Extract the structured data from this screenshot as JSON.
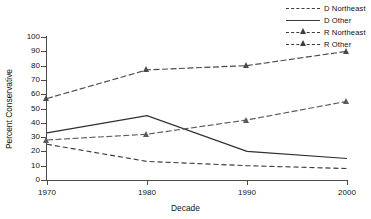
{
  "chart_data": {
    "type": "line",
    "title": "",
    "xlabel": "Decade",
    "ylabel": "Percent Conservative",
    "categories": [
      "1970",
      "1980",
      "1990",
      "2000"
    ],
    "x": [
      1970,
      1980,
      1990,
      2000
    ],
    "xlim": [
      1966,
      2004
    ],
    "ylim": [
      0,
      100
    ],
    "yticks": [
      0,
      10,
      20,
      30,
      40,
      50,
      60,
      70,
      80,
      90,
      100
    ],
    "xticks": [
      1970,
      1980,
      1990,
      2000
    ],
    "grid": false,
    "legend_position": "top-right",
    "series": [
      {
        "name": "D Northeast",
        "values": [
          25,
          13,
          10,
          8
        ],
        "style": "dashed",
        "marker": "none",
        "color": "#3c3c3c"
      },
      {
        "name": "D Other",
        "values": [
          33,
          45,
          20,
          15
        ],
        "style": "solid",
        "marker": "none",
        "color": "#2e2e2e"
      },
      {
        "name": "R Northeast",
        "values": [
          28,
          32,
          42,
          55
        ],
        "style": "dash-dot",
        "marker": "triangle",
        "color": "#5a5a5a"
      },
      {
        "name": "R Other",
        "values": [
          57,
          77,
          80,
          90
        ],
        "style": "dash-dot",
        "marker": "triangle",
        "color": "#4a4a4a"
      }
    ]
  },
  "legend": {
    "items": [
      {
        "label": "D Northeast",
        "style": "dashed",
        "marker": "none"
      },
      {
        "label": "D Other",
        "style": "solid",
        "marker": "none"
      },
      {
        "label": "R Northeast",
        "style": "dash-dot",
        "marker": "triangle"
      },
      {
        "label": "R Other",
        "style": "dash-dot",
        "marker": "triangle"
      }
    ]
  },
  "axes": {
    "x_title": "Decade",
    "y_title": "Percent Conservative",
    "y_tick_labels": [
      "0",
      "10",
      "20",
      "30",
      "40",
      "50",
      "60",
      "70",
      "80",
      "90",
      "100"
    ],
    "x_tick_labels": [
      "1970",
      "1980",
      "1990",
      "2000"
    ]
  },
  "colors": {
    "axis": "#4a4a4a",
    "ink": "#111111",
    "background": "#ffffff"
  }
}
